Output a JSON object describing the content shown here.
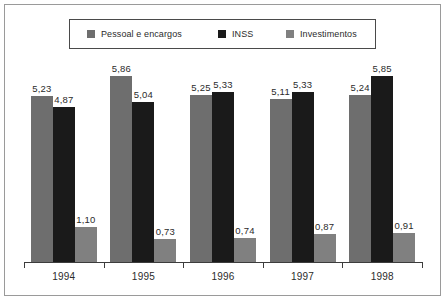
{
  "chart_data": {
    "type": "bar",
    "title": "",
    "subtitle": "",
    "xlabel": "",
    "ylabel": "",
    "categories": [
      "1994",
      "1995",
      "1996",
      "1997",
      "1998"
    ],
    "series": [
      {
        "name": "Pessoal e encargos",
        "color": "#6e6e6e",
        "values": [
          5.23,
          5.86,
          5.25,
          5.11,
          5.24
        ],
        "labels": [
          "5,23",
          "5,86",
          "5,25",
          "5,11",
          "5,24"
        ]
      },
      {
        "name": "INSS",
        "color": "#1a1a1a",
        "values": [
          4.87,
          5.04,
          5.33,
          5.33,
          5.85
        ],
        "labels": [
          "4,87",
          "5,04",
          "5,33",
          "5,33",
          "5,85"
        ]
      },
      {
        "name": "Investimentos",
        "color": "#808080",
        "values": [
          1.1,
          0.73,
          0.74,
          0.87,
          0.91
        ],
        "labels": [
          "1,10",
          "0,73",
          "0,74",
          "0,87",
          "0,91"
        ]
      }
    ],
    "ylim": [
      0,
      6.35
    ],
    "grid": false,
    "legend_position": "top",
    "decimal_separator": ","
  },
  "legend": {
    "entries": [
      {
        "label": "Pessoal e encargos",
        "color": "#6e6e6e"
      },
      {
        "label": "INSS",
        "color": "#1a1a1a"
      },
      {
        "label": "Investimentos",
        "color": "#808080"
      }
    ]
  },
  "axis": {
    "categories": [
      "1994",
      "1995",
      "1996",
      "1997",
      "1998"
    ]
  }
}
